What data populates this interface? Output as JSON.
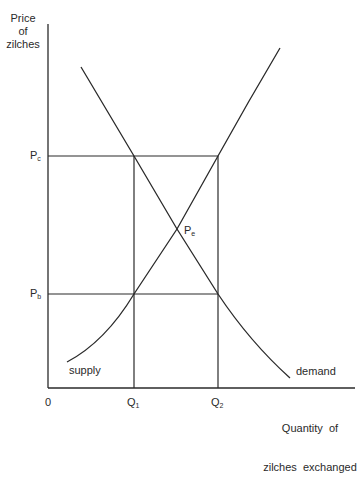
{
  "diagram": {
    "type": "supply-demand",
    "y_axis_label_lines": [
      "Price",
      "of",
      "zilches"
    ],
    "x_axis_label_lines": [
      "Quantity  of",
      "zilches  exchanged"
    ],
    "origin_label": "0",
    "price_levels": [
      {
        "id": "Pc",
        "main": "P",
        "sub": "c"
      },
      {
        "id": "Pb",
        "main": "P",
        "sub": "b"
      }
    ],
    "equilibrium": {
      "main": "P",
      "sub": "e"
    },
    "quantities": [
      {
        "id": "Q1",
        "main": "Q",
        "sub": "1"
      },
      {
        "id": "Q2",
        "main": "Q",
        "sub": "2"
      }
    ],
    "curves": {
      "supply_label": "supply",
      "demand_label": "demand"
    },
    "line_color": "#2a2a2a"
  }
}
